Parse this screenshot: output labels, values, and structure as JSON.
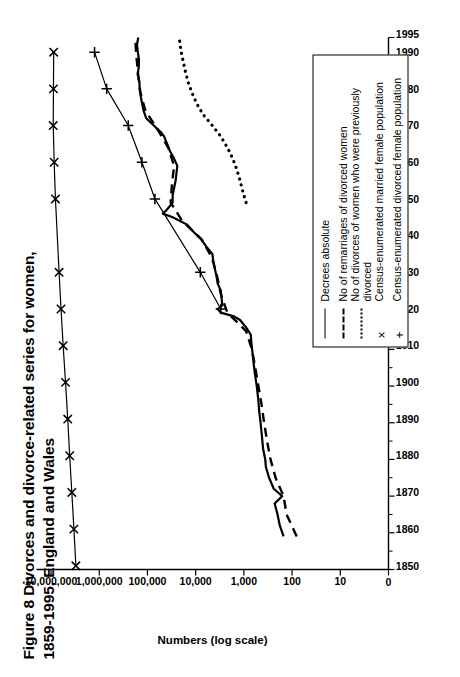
{
  "figure": {
    "title": "Figure 8 Divorces and divorce-related series for women, 1859-1995, England and Wales",
    "title_line1": "Figure 8 Divorces and divorce-related series for women,",
    "title_line2": "1859-1995, England and Wales",
    "rotation": "90-ccw",
    "ink_color": "#000000",
    "paper_color": "#ffffff"
  },
  "chart_data": {
    "type": "line",
    "title": "Figure 8 Divorces and divorce-related series for women, 1859-1995, England and Wales",
    "xlabel": "",
    "ylabel": "Numbers (log scale)",
    "xlim": [
      1850,
      1995
    ],
    "ylim": [
      1,
      20000000
    ],
    "yscale": "log",
    "grid": false,
    "legend_position": "inside-lower-right",
    "x_ticks": [
      1850,
      1860,
      1870,
      1880,
      1890,
      1900,
      1910,
      1920,
      1930,
      1940,
      1950,
      1960,
      1970,
      1980,
      1990,
      1995
    ],
    "x_tick_labels": [
      "1850",
      "1860",
      "1870",
      "1880",
      "1890",
      "1900",
      "1910",
      "1920",
      "1930",
      "1940",
      "1950",
      "1960",
      "1970",
      "1980",
      "1990",
      "1995"
    ],
    "x_minor_ticks": [
      1855,
      1865,
      1875,
      1885,
      1895,
      1905,
      1915,
      1925,
      1935,
      1945,
      1955,
      1965,
      1975,
      1985
    ],
    "y_ticks": [
      1,
      10,
      100,
      1000,
      10000,
      100000,
      1000000,
      10000000
    ],
    "y_tick_labels": [
      "0",
      "10",
      "100",
      "1,000",
      "10,000",
      "100,000",
      "1,000,000",
      "10,000,000"
    ],
    "series": [
      {
        "name": "Decrees absolute",
        "style": "solid",
        "marker": "none",
        "x": [
          1859,
          1862,
          1865,
          1868,
          1870,
          1872,
          1875,
          1878,
          1880,
          1883,
          1886,
          1890,
          1893,
          1896,
          1900,
          1904,
          1908,
          1912,
          1914,
          1916,
          1918,
          1919,
          1920,
          1921,
          1922,
          1924,
          1926,
          1928,
          1930,
          1932,
          1934,
          1936,
          1938,
          1940,
          1942,
          1944,
          1946,
          1947,
          1948,
          1950,
          1952,
          1954,
          1956,
          1958,
          1960,
          1962,
          1964,
          1966,
          1968,
          1969,
          1971,
          1973,
          1975,
          1977,
          1979,
          1981,
          1983,
          1985,
          1987,
          1989,
          1991,
          1993,
          1995
        ],
        "y": [
          150,
          180,
          200,
          230,
          160,
          240,
          300,
          350,
          360,
          400,
          420,
          450,
          480,
          500,
          540,
          600,
          650,
          700,
          720,
          900,
          1200,
          1600,
          3000,
          3500,
          2800,
          2900,
          3000,
          3500,
          3700,
          4000,
          4300,
          4500,
          6000,
          7700,
          11000,
          15000,
          30000,
          48000,
          40000,
          30000,
          30000,
          28000,
          26000,
          25000,
          24000,
          28000,
          34000,
          39000,
          45000,
          51000,
          74000,
          106000,
          120000,
          129000,
          138000,
          145000,
          147000,
          160000,
          151000,
          150000,
          158000,
          165000,
          155000
        ],
        "y_start": 150,
        "y_end": 155000
      },
      {
        "name": "No of remarriages of divorced women",
        "style": "dashed",
        "marker": "none",
        "x": [
          1859,
          1865,
          1870,
          1875,
          1880,
          1885,
          1890,
          1895,
          1900,
          1905,
          1910,
          1915,
          1920,
          1925,
          1930,
          1935,
          1940,
          1945,
          1950,
          1955,
          1960,
          1965,
          1970,
          1975,
          1980,
          1985,
          1990,
          1995
        ],
        "y": [
          80,
          130,
          150,
          220,
          280,
          330,
          380,
          430,
          500,
          580,
          680,
          900,
          2200,
          3000,
          3600,
          4600,
          7500,
          19000,
          33000,
          31000,
          28000,
          37000,
          62000,
          110000,
          140000,
          156000,
          170000,
          180000
        ],
        "y_start": 80,
        "y_end": 180000
      },
      {
        "name": "No of divorces of women who were previously divorced",
        "style": "dotted",
        "marker": "none",
        "x": [
          1950,
          1953,
          1956,
          1959,
          1962,
          1965,
          1968,
          1971,
          1974,
          1977,
          1980,
          1983,
          1986,
          1989,
          1992,
          1995
        ],
        "y": [
          900,
          1050,
          1200,
          1400,
          1700,
          2200,
          3000,
          4500,
          7000,
          9500,
          12000,
          14500,
          16500,
          18500,
          20500,
          22000
        ],
        "y_start": 900,
        "y_end": 22000
      },
      {
        "name": "Census-enumerated married female population",
        "style": "solid",
        "marker": "x",
        "x": [
          1851,
          1861,
          1871,
          1881,
          1891,
          1901,
          1911,
          1921,
          1931,
          1951,
          1961,
          1971,
          1981,
          1991
        ],
        "y": [
          3050000,
          3350000,
          3700000,
          4100000,
          4500000,
          5000000,
          5600000,
          6200000,
          6800000,
          8100000,
          8600000,
          9000000,
          8900000,
          8800000
        ],
        "y_start": 3050000,
        "y_end": 8800000
      },
      {
        "name": "Census-enumerated divorced female population",
        "style": "solid",
        "marker": "plus",
        "x": [
          1921,
          1931,
          1951,
          1961,
          1971,
          1981,
          1991
        ],
        "y": [
          3000,
          8000,
          70000,
          130000,
          250000,
          700000,
          1250000
        ],
        "y_start": 3000,
        "y_end": 1250000
      }
    ]
  },
  "axes": {
    "y_axis_title": "Numbers (log scale)",
    "x_axis_title": ""
  },
  "legend": {
    "entries": [
      {
        "label": "Decrees absolute",
        "symbol": "solid-line",
        "symbol_glyph": ""
      },
      {
        "label": "No of remarriages of divorced women",
        "symbol": "dashed-line",
        "symbol_glyph": ""
      },
      {
        "label": "No of divorces of women who were previously divorced",
        "symbol": "dotted-line",
        "symbol_glyph": ""
      },
      {
        "label": "Census-enumerated married female population",
        "symbol": "x-marker",
        "symbol_glyph": "×"
      },
      {
        "label": "Census-enumerated divorced female population",
        "symbol": "plus-marker",
        "symbol_glyph": "+"
      }
    ]
  }
}
